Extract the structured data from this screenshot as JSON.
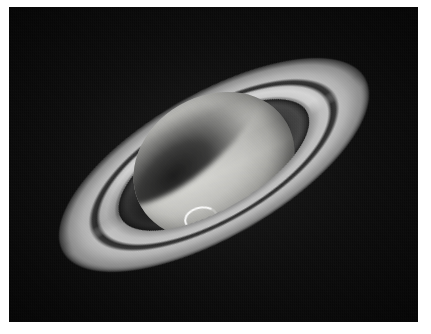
{
  "image": {
    "subject": "Saturn",
    "description": "Telescopic grayscale photograph of the planet Saturn with its ring system tilted toward the viewer",
    "alt_text": "Saturn and its rings photographed against a black sky",
    "orientation": "landscape",
    "color_mode": "grayscale"
  },
  "frame": {
    "border_color": "#ffffff",
    "border_width_px": 8
  },
  "sky": {
    "background_color": "#0b0b0b",
    "label": "night sky background"
  },
  "features": {
    "planet": {
      "label": "Saturn globe",
      "highlight_color": "#d8d8d4",
      "midtone_color": "#c0c0bc",
      "shadow_color": "#6e6e6b",
      "band_description": "horizontal latitudinal cloud bands"
    },
    "ring_a": {
      "label": "A ring",
      "color": "#c6c6c6"
    },
    "cassini_division": {
      "label": "Cassini Division",
      "color": "#1e1e1e"
    },
    "ring_b": {
      "label": "B ring",
      "color": "#d6d6d6"
    },
    "ring_c": {
      "label": "C ring",
      "color": "#878787"
    },
    "ring_shadow": {
      "label": "ring shadow on northern hemisphere",
      "color": "#141414"
    },
    "globe_shadow": {
      "label": "planet shadow cast on rings",
      "color": "#0a0a0a"
    },
    "storm": {
      "label": "bright crescent storm in southern hemisphere",
      "color": "#ffffff"
    }
  }
}
